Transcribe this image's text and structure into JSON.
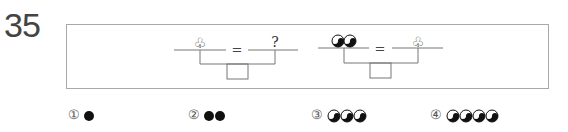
{
  "question": {
    "number": "35"
  },
  "equations": [
    {
      "left_symbol": "club-icon",
      "left_text": "♧",
      "operator": "=",
      "right_symbol": "question-mark",
      "right_text": "?"
    },
    {
      "left_symbol": "yin-yang-pair-icon",
      "left_text": "☯☯",
      "operator": "=",
      "right_symbol": "club-icon",
      "right_text": "♧"
    }
  ],
  "options": [
    {
      "marker": "①",
      "symbol": "black-circle",
      "count": 1
    },
    {
      "marker": "②",
      "symbol": "black-circle",
      "count": 2
    },
    {
      "marker": "③",
      "symbol": "yin-yang",
      "count": 3
    },
    {
      "marker": "④",
      "symbol": "yin-yang",
      "count": 4
    }
  ],
  "colors": {
    "line": "#777777",
    "frame": "#a8a8a8",
    "ink": "#111111"
  }
}
